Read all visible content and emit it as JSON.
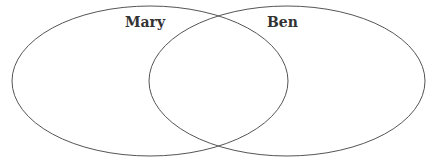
{
  "diagram": {
    "type": "venn",
    "stroke_color": "#555555",
    "sets": [
      {
        "label": "Mary",
        "cx": 150,
        "cy": 81,
        "rx": 138,
        "ry": 75
      },
      {
        "label": "Ben",
        "cx": 287,
        "cy": 81,
        "rx": 138,
        "ry": 75
      }
    ]
  }
}
